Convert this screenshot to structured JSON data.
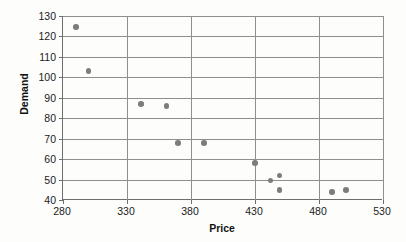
{
  "chart_data": {
    "type": "scatter",
    "title": "",
    "xlabel": "Price",
    "ylabel": "Demand",
    "xlim": [
      280,
      530
    ],
    "ylim": [
      40,
      130
    ],
    "xticks": [
      280,
      330,
      380,
      430,
      480,
      530
    ],
    "yticks": [
      40,
      50,
      60,
      70,
      80,
      90,
      100,
      110,
      120,
      130
    ],
    "grid": true,
    "legend": "none",
    "marker_color": "#7d7d7d",
    "axis_color": "#6e6e6e",
    "grid_color": "#8f8f8f",
    "points": [
      {
        "x": 290,
        "y": 124.5
      },
      {
        "x": 300,
        "y": 103
      },
      {
        "x": 341,
        "y": 87
      },
      {
        "x": 361,
        "y": 86
      },
      {
        "x": 370,
        "y": 68
      },
      {
        "x": 390,
        "y": 68
      },
      {
        "x": 430,
        "y": 58
      },
      {
        "x": 442,
        "y": 49.5
      },
      {
        "x": 449,
        "y": 52
      },
      {
        "x": 449,
        "y": 45
      },
      {
        "x": 490,
        "y": 44
      },
      {
        "x": 501,
        "y": 45
      }
    ]
  }
}
